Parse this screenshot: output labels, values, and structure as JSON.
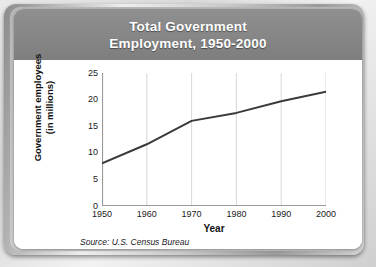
{
  "card": {
    "title_line_1": "Total Government",
    "title_line_2": "Employment, 1950-2000",
    "header_color": "#888888",
    "background_color": "#ffffff",
    "frame_color": "#bdbdbd"
  },
  "source": {
    "text": "Source: U.S. Census Bureau"
  },
  "chart_data": {
    "type": "line",
    "title": "Total Government Employment, 1950-2000",
    "xlabel": "Year",
    "ylabel": "Government employees (in millions)",
    "ylabel_line_1": "Government employees",
    "ylabel_line_2": "(in millions)",
    "x": [
      1950,
      1960,
      1970,
      1980,
      1990,
      2000
    ],
    "values": [
      8.0,
      11.6,
      16.0,
      17.5,
      19.7,
      21.5
    ],
    "xtick_labels": [
      "1950",
      "1960",
      "1970",
      "1980",
      "1990",
      "2000"
    ],
    "ytick_labels": [
      "0",
      "5",
      "10",
      "15",
      "20",
      "25"
    ],
    "ytick_values": [
      0,
      5,
      10,
      15,
      20,
      25
    ],
    "xlim": [
      1950,
      2000
    ],
    "ylim": [
      0,
      25
    ],
    "grid": "vertical",
    "gridline_color": "#d8d8d8",
    "line_color": "#3a3a3a",
    "line_width": 2,
    "legend": "none",
    "marker": "none"
  }
}
